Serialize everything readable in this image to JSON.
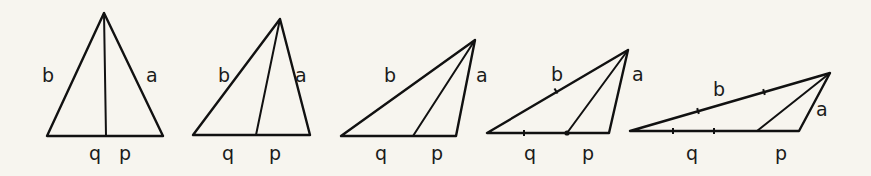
{
  "diagram": {
    "colors": {
      "background": "#f7f5ef",
      "stroke": "#111111"
    },
    "triangles": [
      {
        "id": 1,
        "apex": [
          104,
          13
        ],
        "base_left": [
          47,
          136
        ],
        "base_right": [
          163,
          136
        ],
        "foot": [
          106,
          136
        ],
        "ticks": [],
        "labels": {
          "b": {
            "text": "b",
            "x": 42,
            "y": 82
          },
          "a": {
            "text": "a",
            "x": 146,
            "y": 82
          },
          "q": {
            "text": "q",
            "x": 89,
            "y": 160
          },
          "p": {
            "text": "p",
            "x": 119,
            "y": 160
          }
        }
      },
      {
        "id": 2,
        "apex": [
          280,
          19
        ],
        "base_left": [
          193,
          135
        ],
        "base_right": [
          310,
          135
        ],
        "foot": [
          256,
          135
        ],
        "ticks": [],
        "labels": {
          "b": {
            "text": "b",
            "x": 218,
            "y": 82
          },
          "a": {
            "text": "a",
            "x": 295,
            "y": 82
          },
          "q": {
            "text": "q",
            "x": 222,
            "y": 160
          },
          "p": {
            "text": "p",
            "x": 269,
            "y": 160
          }
        }
      },
      {
        "id": 3,
        "apex": [
          475,
          40
        ],
        "base_left": [
          341,
          136
        ],
        "base_right": [
          456,
          136
        ],
        "foot": [
          413,
          136
        ],
        "ticks": [],
        "labels": {
          "b": {
            "text": "b",
            "x": 384,
            "y": 82
          },
          "a": {
            "text": "a",
            "x": 476,
            "y": 82
          },
          "q": {
            "text": "q",
            "x": 375,
            "y": 160
          },
          "p": {
            "text": "p",
            "x": 431,
            "y": 160
          }
        }
      },
      {
        "id": 4,
        "apex": [
          628,
          50
        ],
        "base_left": [
          487,
          133
        ],
        "base_right": [
          609,
          133
        ],
        "foot": [
          567,
          133
        ],
        "ticks": [
          [
            524,
            133,
            "v"
          ],
          [
            556,
            91,
            "s"
          ],
          [
            567,
            133,
            "dot"
          ]
        ],
        "labels": {
          "b": {
            "text": "b",
            "x": 551,
            "y": 81
          },
          "a": {
            "text": "a",
            "x": 632,
            "y": 81
          },
          "q": {
            "text": "q",
            "x": 524,
            "y": 160
          },
          "p": {
            "text": "p",
            "x": 582,
            "y": 160
          }
        }
      },
      {
        "id": 5,
        "apex": [
          830,
          73
        ],
        "base_left": [
          630,
          131
        ],
        "base_right": [
          799,
          131
        ],
        "foot": [
          757,
          131
        ],
        "ticks": [
          [
            673,
            131,
            "v"
          ],
          [
            714,
            131,
            "v"
          ],
          [
            698,
            111,
            "s"
          ],
          [
            764,
            92,
            "s"
          ]
        ],
        "labels": {
          "b": {
            "text": "b",
            "x": 713,
            "y": 96
          },
          "a": {
            "text": "a",
            "x": 816,
            "y": 116
          },
          "q": {
            "text": "q",
            "x": 686,
            "y": 160
          },
          "p": {
            "text": "p",
            "x": 775,
            "y": 160
          }
        }
      }
    ]
  }
}
